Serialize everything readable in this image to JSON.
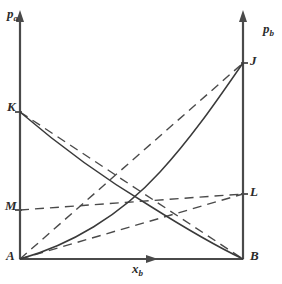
{
  "figure": {
    "type": "line-diagram",
    "background_color": "#ffffff",
    "line_color": "#3a3a3a",
    "axis_color": "#4a4a4a"
  },
  "axes": {
    "left": {
      "label": "p",
      "subscript": "a",
      "name": "p_a",
      "arrow": "up",
      "x_px": 20,
      "top_px": 14,
      "bottom_px": 259
    },
    "right": {
      "label": "p",
      "subscript": "b",
      "name": "p_b",
      "arrow": "up",
      "x_px": 243,
      "top_px": 14,
      "bottom_px": 259
    },
    "bottom": {
      "label": "x",
      "subscript": "b",
      "name": "x_b",
      "arrow": "right",
      "y_px": 259,
      "left_px": 20,
      "right_px": 243
    }
  },
  "points": [
    {
      "id": "A",
      "label": "A",
      "axis": "left",
      "x_px": 20,
      "y_px": 259,
      "meaning": "origin, pure a"
    },
    {
      "id": "K",
      "label": "K",
      "axis": "left",
      "x_px": 20,
      "y_px": 112,
      "meaning": "vapour pressure of pure a"
    },
    {
      "id": "M",
      "label": "M",
      "axis": "left",
      "x_px": 20,
      "y_px": 210,
      "meaning": "Henry's law intercept on left axis"
    },
    {
      "id": "B",
      "label": "B",
      "axis": "right",
      "x_px": 243,
      "y_px": 259,
      "meaning": "origin, pure b"
    },
    {
      "id": "J",
      "label": "J",
      "axis": "right",
      "x_px": 243,
      "y_px": 63,
      "meaning": "vapour pressure of pure b"
    },
    {
      "id": "L",
      "label": "L",
      "axis": "right",
      "x_px": 243,
      "y_px": 194,
      "meaning": "Henry's law intercept on right axis"
    }
  ],
  "curves": [
    {
      "id": "curve-KB",
      "name": "partial-pressure-a-real",
      "style": "solid",
      "from": "K",
      "to": "B",
      "shape": "concave-up-decreasing",
      "path": "M 20 112 C 62 148, 110 182, 150 206 C 185 228, 220 248, 243 259"
    },
    {
      "id": "curve-AJ",
      "name": "partial-pressure-b-real",
      "style": "solid",
      "from": "A",
      "to": "J",
      "shape": "concave-up-increasing",
      "path": "M 20 259 C 70 245, 120 216, 160 172 C 195 134, 224 90, 243 63"
    },
    {
      "id": "line-KB",
      "name": "raoult-ideal-a",
      "style": "dashed",
      "from": "K",
      "to": "B",
      "shape": "straight",
      "path": "M 20 112 L 243 259"
    },
    {
      "id": "line-AJ",
      "name": "raoult-ideal-b",
      "style": "dashed",
      "from": "A",
      "to": "J",
      "shape": "straight",
      "path": "M 20 259 L 243 63"
    },
    {
      "id": "line-ML",
      "name": "henry-tangent-from-M",
      "style": "dashed",
      "from": "M",
      "to": "L",
      "shape": "straight",
      "path": "M 20 210 L 243 194"
    },
    {
      "id": "line-AL",
      "name": "henry-tangent-from-A",
      "style": "dashed",
      "from": "A",
      "to": "L",
      "shape": "straight",
      "path": "M 20 259 L 243 194"
    }
  ],
  "ticks": [
    {
      "id": "tick-K",
      "point": "K",
      "axis": "left",
      "x_px": 20,
      "y_px": 112
    },
    {
      "id": "tick-M",
      "point": "M",
      "axis": "left",
      "x_px": 20,
      "y_px": 210
    },
    {
      "id": "tick-J",
      "point": "J",
      "axis": "right",
      "x_px": 243,
      "y_px": 63
    },
    {
      "id": "tick-L",
      "point": "L",
      "axis": "right",
      "x_px": 243,
      "y_px": 194
    }
  ]
}
